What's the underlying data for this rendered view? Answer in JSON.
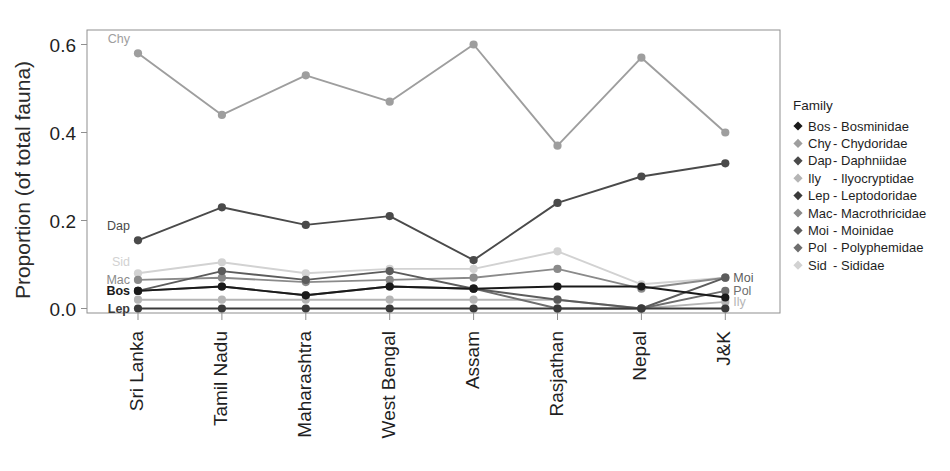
{
  "chart_data": {
    "type": "line",
    "title": "",
    "xlabel": "",
    "ylabel": "Proportion (of total fauna)",
    "categories": [
      "Sri Lanka",
      "Tamil Nadu",
      "Maharashtra",
      "West Bengal",
      "Assam",
      "Rasjathan",
      "Nepal",
      "J&K"
    ],
    "ylim": [
      0.0,
      0.62
    ],
    "yticks": [
      "0.0",
      "0.2",
      "0.4",
      "0.6"
    ],
    "ytick_values": [
      0.0,
      0.2,
      0.4,
      0.6
    ],
    "grid": false,
    "legend_position": "right",
    "legend_title": "Family",
    "series": [
      {
        "name": "Bos",
        "code": "Bos",
        "family": "Bosminidae",
        "legend_label": "Bos - Bosminidae",
        "color": "#1a1a1a",
        "inline_label": "Bos",
        "inline_label_side": "left",
        "values": [
          0.04,
          0.05,
          0.03,
          0.05,
          0.045,
          0.05,
          0.05,
          0.025
        ]
      },
      {
        "name": "Chy",
        "code": "Chy",
        "family": "Chydoridae",
        "legend_label": "Chy - Chydoridae",
        "color": "#9e9e9e",
        "inline_label": "Chy",
        "inline_label_side": "left",
        "values": [
          0.58,
          0.44,
          0.53,
          0.47,
          0.6,
          0.37,
          0.57,
          0.4
        ]
      },
      {
        "name": "Dap",
        "code": "Dap",
        "family": "Daphniidae",
        "legend_label": "Dap- Daphniidae",
        "color": "#4a4a4a",
        "inline_label": "Dap",
        "inline_label_side": "left",
        "values": [
          0.155,
          0.23,
          0.19,
          0.21,
          0.11,
          0.24,
          0.3,
          0.33
        ]
      },
      {
        "name": "Ily",
        "code": "Ily",
        "family": "Ilyocryptidae",
        "legend_label": "Ily   - Ilyocryptidae",
        "color": "#b5b5b5",
        "inline_label": "Ily",
        "inline_label_side": "right",
        "values": [
          0.02,
          0.02,
          0.02,
          0.02,
          0.02,
          0.02,
          0.0,
          0.015
        ]
      },
      {
        "name": "Lep",
        "code": "Lep",
        "family": "Leptodoridae",
        "legend_label": "Lep - Leptodoridae",
        "color": "#3a3a3a",
        "inline_label": "Lep",
        "inline_label_side": "left",
        "values": [
          0.0,
          0.0,
          0.0,
          0.0,
          0.0,
          0.0,
          0.0,
          0.0
        ]
      },
      {
        "name": "Mac",
        "code": "Mac",
        "family": "Macrothricidae",
        "legend_label": "Mac- Macrothricidae",
        "color": "#8a8a8a",
        "inline_label": "Mac",
        "inline_label_side": "left",
        "values": [
          0.065,
          0.07,
          0.06,
          0.065,
          0.07,
          0.09,
          0.045,
          0.07
        ]
      },
      {
        "name": "Moi",
        "code": "Moi",
        "family": "Moinidae",
        "legend_label": "Moi - Moinidae",
        "color": "#5c5c5c",
        "inline_label": "Moi",
        "inline_label_side": "right",
        "values": [
          0.04,
          0.085,
          0.065,
          0.085,
          0.045,
          0.02,
          0.0,
          0.07
        ]
      },
      {
        "name": "Pol",
        "code": "Pol",
        "family": "Polyphemidae",
        "legend_label": "Pol  - Polyphemidae",
        "color": "#6e6e6e",
        "inline_label": "Pol",
        "inline_label_side": "right",
        "values": [
          0.04,
          0.05,
          0.03,
          0.05,
          0.045,
          0.0,
          0.0,
          0.04
        ]
      },
      {
        "name": "Sid",
        "code": "Sid",
        "family": "Sididae",
        "legend_label": "Sid  - Sididae",
        "color": "#d2d2d2",
        "inline_label": "Sid",
        "inline_label_side": "left",
        "values": [
          0.08,
          0.105,
          0.08,
          0.09,
          0.09,
          0.13,
          0.055,
          0.07
        ]
      }
    ]
  },
  "axis": {
    "ylabel": "Proportion (of total fauna)",
    "panel_border_color": "#8f8f8f",
    "tick_color": "#8f8f8f"
  },
  "legend": {
    "title": "Family",
    "marker_shape": "diamond",
    "items": [
      {
        "code": "Bos",
        "sep": "-",
        "family": "Bosminidae",
        "color": "#1a1a1a"
      },
      {
        "code": "Chy",
        "sep": "-",
        "family": "Chydoridae",
        "color": "#9e9e9e"
      },
      {
        "code": "Dap",
        "sep": "-",
        "family": "Daphniidae",
        "color": "#4a4a4a"
      },
      {
        "code": "Ily",
        "sep": "-",
        "family": "Ilyocryptidae",
        "color": "#b5b5b5"
      },
      {
        "code": "Lep",
        "sep": "-",
        "family": "Leptodoridae",
        "color": "#3a3a3a"
      },
      {
        "code": "Mac",
        "sep": "-",
        "family": "Macrothricidae",
        "color": "#8a8a8a"
      },
      {
        "code": "Moi",
        "sep": "-",
        "family": "Moinidae",
        "color": "#5c5c5c"
      },
      {
        "code": "Pol",
        "sep": "-",
        "family": "Polyphemidae",
        "color": "#6e6e6e"
      },
      {
        "code": "Sid",
        "sep": "-",
        "family": "Sididae",
        "color": "#d2d2d2"
      }
    ]
  }
}
